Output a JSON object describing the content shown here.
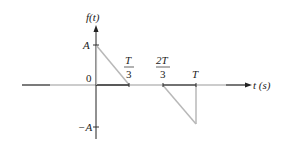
{
  "diagram": {
    "y_axis_label": "f(t)",
    "x_axis_label": "t (s)",
    "y_ticks": [
      {
        "label": "A",
        "value": 1
      },
      {
        "label": "0",
        "value": 0
      },
      {
        "label": "−A",
        "value": -1
      }
    ],
    "x_ticks": [
      {
        "num": "T",
        "den": "3",
        "value": 0.3333
      },
      {
        "num": "2T",
        "den": "3",
        "value": 0.6667
      },
      {
        "label": "T",
        "value": 1
      }
    ],
    "signal_segments": [
      {
        "from": [
          0,
          1
        ],
        "to": [
          0.3333,
          0
        ]
      },
      {
        "from": [
          0.6667,
          0
        ],
        "to": [
          1,
          -1
        ]
      },
      {
        "from": [
          1,
          -1
        ],
        "to": [
          1,
          0
        ]
      }
    ],
    "colors": {
      "axis": "#1a1a1a",
      "signal": "#b8b8b8"
    }
  }
}
